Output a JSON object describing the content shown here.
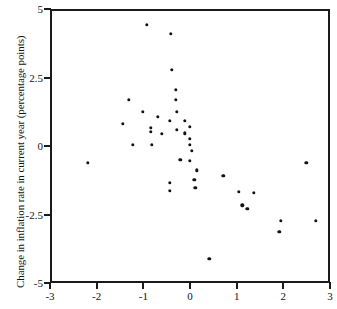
{
  "chart_data": {
    "type": "scatter",
    "title": "",
    "subtitle": "",
    "xlabel": "",
    "ylabel": "Change in inflation rate in current year (percentage points)",
    "xlim": [
      -3,
      3
    ],
    "ylim": [
      -5,
      5
    ],
    "grid": false,
    "legend": null,
    "xticks": [
      -3,
      -2,
      -1,
      0,
      1,
      2,
      3
    ],
    "xtick_labels": [
      "-3",
      "-2",
      "-1",
      "0",
      "1",
      "2",
      "3"
    ],
    "yticks": [
      -5,
      -2.5,
      0,
      2.5,
      5
    ],
    "ytick_labels": [
      "-5",
      "-2.5",
      "0",
      "2.5",
      "5"
    ],
    "marker": "filled-circle",
    "marker_color": "#111111",
    "points": [
      {
        "x": -0.92,
        "y": 4.42
      },
      {
        "x": -0.41,
        "y": 4.09
      },
      {
        "x": -0.39,
        "y": 2.77
      },
      {
        "x": -0.3,
        "y": 2.04
      },
      {
        "x": -1.31,
        "y": 1.68
      },
      {
        "x": -0.3,
        "y": 1.68
      },
      {
        "x": -1.01,
        "y": 1.24
      },
      {
        "x": -0.69,
        "y": 1.06
      },
      {
        "x": -1.44,
        "y": 0.8
      },
      {
        "x": -0.43,
        "y": 0.91
      },
      {
        "x": -0.28,
        "y": 1.24
      },
      {
        "x": -0.84,
        "y": 0.66
      },
      {
        "x": -0.84,
        "y": 0.51
      },
      {
        "x": -0.6,
        "y": 0.44
      },
      {
        "x": -0.28,
        "y": 0.58
      },
      {
        "x": -0.11,
        "y": 0.91
      },
      {
        "x": -0.11,
        "y": 0.47
      },
      {
        "x": 0.0,
        "y": 0.69
      },
      {
        "x": 0.0,
        "y": 0.26
      },
      {
        "x": -1.22,
        "y": 0.04
      },
      {
        "x": -0.82,
        "y": 0.04
      },
      {
        "x": 0.0,
        "y": 0.04
      },
      {
        "x": 0.04,
        "y": -0.18
      },
      {
        "x": -2.19,
        "y": -0.62
      },
      {
        "x": -0.21,
        "y": -0.51
      },
      {
        "x": 0.0,
        "y": -0.55
      },
      {
        "x": 0.15,
        "y": -0.88
      },
      {
        "x": -0.43,
        "y": -1.35
      },
      {
        "x": -0.43,
        "y": -1.64
      },
      {
        "x": 0.09,
        "y": -1.24
      },
      {
        "x": 0.11,
        "y": -1.53
      },
      {
        "x": 0.71,
        "y": -1.09
      },
      {
        "x": 1.05,
        "y": -1.68
      },
      {
        "x": 1.12,
        "y": -2.16
      },
      {
        "x": 1.23,
        "y": -2.3
      },
      {
        "x": 1.37,
        "y": -1.71
      },
      {
        "x": 1.91,
        "y": -3.14
      },
      {
        "x": 1.95,
        "y": -2.74
      },
      {
        "x": 2.49,
        "y": -0.62
      },
      {
        "x": 2.7,
        "y": -2.74
      },
      {
        "x": 0.41,
        "y": -4.12
      }
    ]
  }
}
